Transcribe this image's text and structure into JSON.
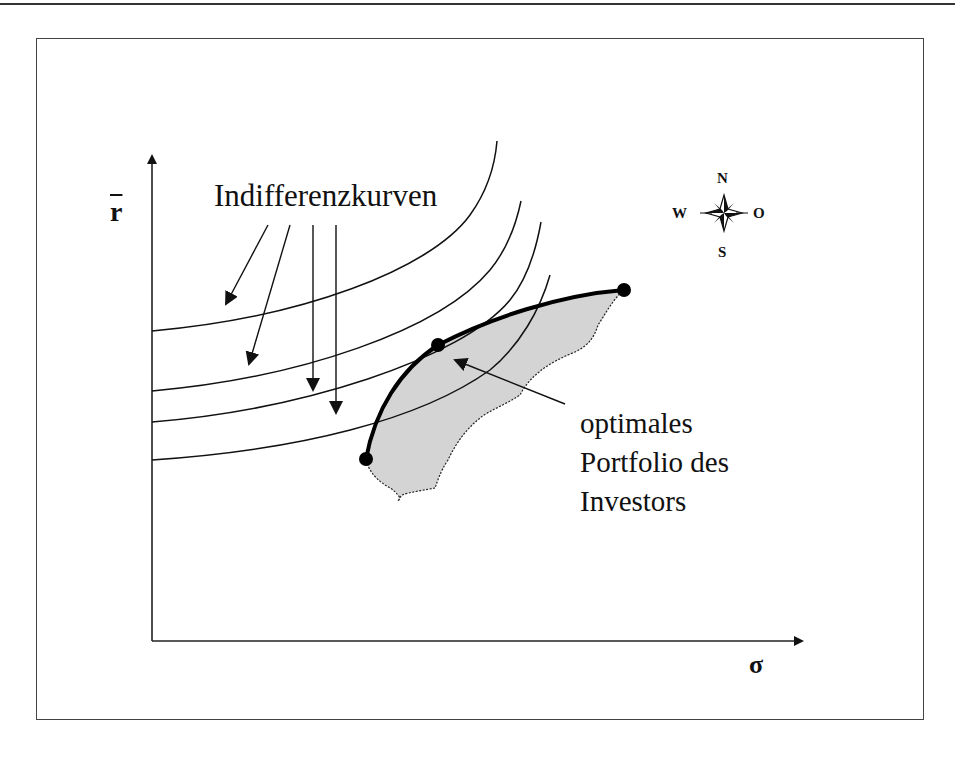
{
  "diagram": {
    "title_fragment": "",
    "axes": {
      "y_label": "r",
      "y_label_note": "r with overbar (expected return)",
      "x_label": "σ"
    },
    "labels": {
      "indifference_curves": "Indifferenzkurven",
      "optimal_portfolio": [
        "optimales",
        "Portfolio des",
        "Investors"
      ]
    },
    "compass": {
      "north": "N",
      "south": "S",
      "west": "W",
      "east": "O"
    },
    "colors": {
      "line": "#111111",
      "feasible_region_fill": "#d4d4d4",
      "frame": "#444444"
    },
    "elements": {
      "indifference_curve_count": 4,
      "efficient_frontier_points": 3,
      "optimal_point": "tangency of frontier with indifference curve"
    }
  }
}
